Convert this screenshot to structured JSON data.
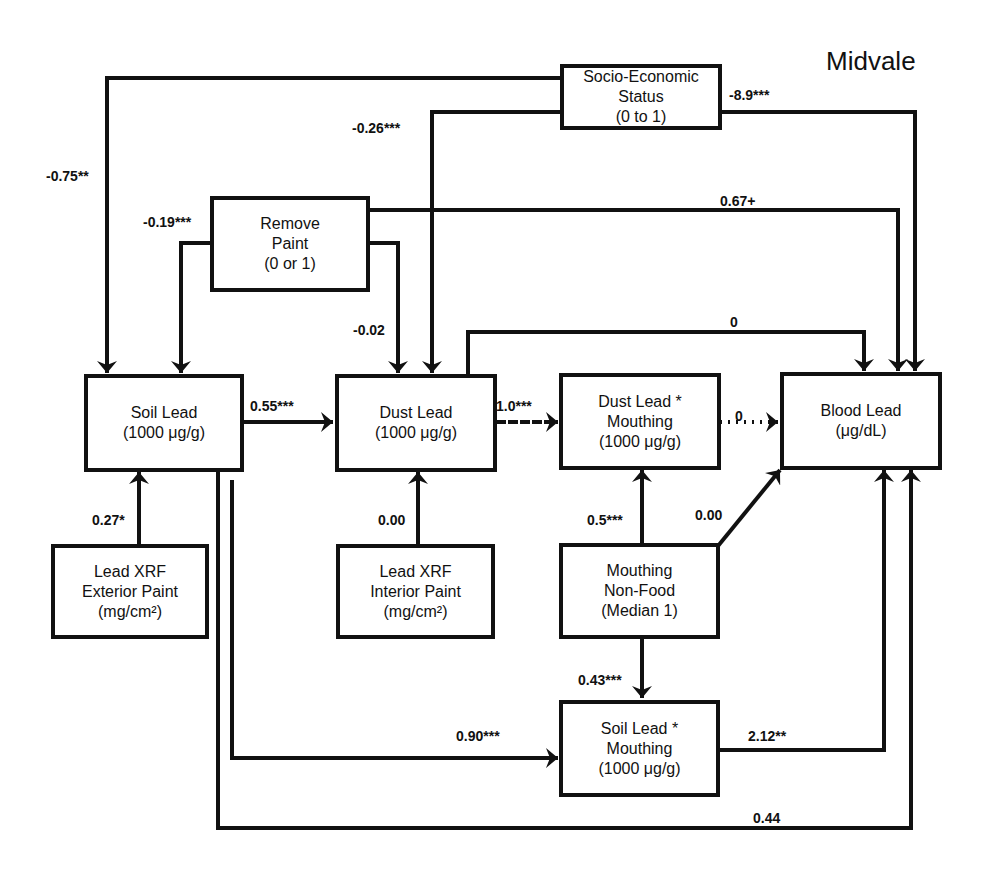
{
  "title": "Midvale",
  "nodes": {
    "ses": {
      "lines": [
        "Socio-Economic",
        "Status",
        "(0 to 1)"
      ]
    },
    "remove_paint": {
      "lines": [
        "Remove",
        "Paint",
        "(0 or 1)"
      ]
    },
    "soil_lead": {
      "lines": [
        "Soil Lead",
        "(1000 μg/g)"
      ]
    },
    "dust_lead": {
      "lines": [
        "Dust Lead",
        "(1000 μg/g)"
      ]
    },
    "dust_mouthing": {
      "lines": [
        "Dust Lead *",
        "Mouthing",
        "(1000 μg/g)"
      ]
    },
    "blood_lead": {
      "lines": [
        "Blood Lead",
        "(μg/dL)"
      ]
    },
    "xrf_exterior": {
      "lines": [
        "Lead XRF",
        "Exterior Paint",
        "(mg/cm²)"
      ]
    },
    "xrf_interior": {
      "lines": [
        "Lead XRF",
        "Interior Paint",
        "(mg/cm²)"
      ]
    },
    "mouthing": {
      "lines": [
        "Mouthing",
        "Non-Food",
        "(Median 1)"
      ]
    },
    "soil_mouthing": {
      "lines": [
        "Soil Lead *",
        "Mouthing",
        "(1000 μg/g)"
      ]
    }
  },
  "edges": [
    {
      "from": "Socio-Economic Status",
      "to": "Soil Lead",
      "coef": "-0.75**"
    },
    {
      "from": "Socio-Economic Status",
      "to": "Dust Lead",
      "coef": "-0.26***"
    },
    {
      "from": "Socio-Economic Status",
      "to": "Blood Lead",
      "coef": "-8.9***"
    },
    {
      "from": "Remove Paint",
      "to": "Soil Lead",
      "coef": "-0.19***"
    },
    {
      "from": "Remove Paint",
      "to": "Dust Lead",
      "coef": "-0.02"
    },
    {
      "from": "Remove Paint",
      "to": "Blood Lead",
      "coef": "0.67+"
    },
    {
      "from": "Dust Lead",
      "to": "Blood Lead",
      "coef": "0"
    },
    {
      "from": "Soil Lead",
      "to": "Dust Lead",
      "coef": "0.55***"
    },
    {
      "from": "Dust Lead",
      "to": "Dust Lead * Mouthing",
      "coef": "1.0***"
    },
    {
      "from": "Dust Lead * Mouthing",
      "to": "Blood Lead",
      "coef": "0"
    },
    {
      "from": "Lead XRF Exterior Paint",
      "to": "Soil Lead",
      "coef": "0.27*"
    },
    {
      "from": "Lead XRF Interior Paint",
      "to": "Dust Lead",
      "coef": "0.00"
    },
    {
      "from": "Mouthing Non-Food",
      "to": "Dust Lead * Mouthing",
      "coef": "0.5***"
    },
    {
      "from": "Mouthing Non-Food",
      "to": "Blood Lead",
      "coef": "0.00"
    },
    {
      "from": "Mouthing Non-Food",
      "to": "Soil Lead * Mouthing",
      "coef": "0.43***"
    },
    {
      "from": "Soil Lead",
      "to": "Soil Lead * Mouthing",
      "coef": "0.90***"
    },
    {
      "from": "Soil Lead * Mouthing",
      "to": "Blood Lead",
      "coef": "2.12**"
    },
    {
      "from": "Soil Lead",
      "to": "Blood Lead",
      "coef": "0.44"
    }
  ]
}
